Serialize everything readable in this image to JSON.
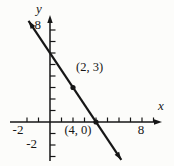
{
  "figure": {
    "colors": {
      "ink": "#161616",
      "background": "#fcfcfa"
    }
  },
  "chart_data": {
    "type": "line",
    "title": "",
    "xlabel": "x",
    "ylabel": "y",
    "x_range": [
      -2.5,
      9.5
    ],
    "y_range": [
      -3.3,
      8.8
    ],
    "grid": false,
    "x_ticks": [
      -2,
      -1,
      1,
      2,
      3,
      4,
      5,
      6,
      7,
      8,
      9
    ],
    "y_ticks": [
      -3,
      -2,
      -1,
      1,
      2,
      3,
      4,
      5,
      6,
      7,
      8
    ],
    "x_labeled_ticks": [
      {
        "value": -2,
        "label": "-2"
      },
      {
        "value": 8,
        "label": "8"
      }
    ],
    "y_labeled_ticks": [
      {
        "value": 8,
        "label": "8"
      },
      {
        "value": -2,
        "label": "-2"
      }
    ],
    "line": {
      "slope": -1.5,
      "y_intercept": 6,
      "x_intercept": 4,
      "draw_y_range": [
        -3.3,
        8.8
      ]
    },
    "points": [
      {
        "x": 2,
        "y": 3,
        "label": "(2, 3)"
      },
      {
        "x": 4,
        "y": 0,
        "label": "(4, 0)"
      }
    ]
  }
}
